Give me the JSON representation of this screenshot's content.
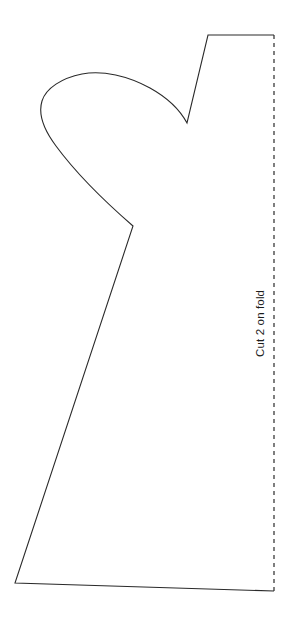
{
  "document": {
    "type": "sewing-pattern-template",
    "title": "Cut 2 on fold",
    "background_color": "#ffffff",
    "line_color": "#2a2a2a",
    "line_width": 1.1,
    "canvas": {
      "width": 293,
      "height": 627
    }
  },
  "annotations": {
    "fold_label": "Cut 2 on fold",
    "fold_label_rotation": -90,
    "fold_label_color": "#1c1c1c",
    "fold_label_font_size": 11.5
  },
  "fold_line": {
    "name": "fold-edge",
    "style": "dashed",
    "dash_pattern": "4 4",
    "color": "#2a2a2a",
    "x": 274,
    "y_start": 35,
    "y_end": 591
  },
  "outline": {
    "name": "pattern-cut-outline",
    "style": "solid",
    "color": "#2a2a2a",
    "path": "M 274 35 L 208 35 L 187 123 C 180 110 168 98 150 88 C 128 76 103 70 82 74 C 62 78 46 88 42 101 C 38 114 44 130 56 146 C 70 165 95 193 133 226 L 15 583 L 274 591",
    "key_points": [
      {
        "label": "top-right-fold-corner",
        "x": 274,
        "y": 35
      },
      {
        "label": "shoulder-top-left",
        "x": 208,
        "y": 35
      },
      {
        "label": "neck-notch-vertex",
        "x": 187,
        "y": 123
      },
      {
        "label": "ear-curve-apex",
        "x": 82,
        "y": 74
      },
      {
        "label": "ear-curve-leftmost",
        "x": 41,
        "y": 101
      },
      {
        "label": "underarm-notch-vertex",
        "x": 133,
        "y": 226
      },
      {
        "label": "bottom-left-corner",
        "x": 15,
        "y": 583
      },
      {
        "label": "bottom-right-fold-corner",
        "x": 274,
        "y": 591
      }
    ]
  }
}
